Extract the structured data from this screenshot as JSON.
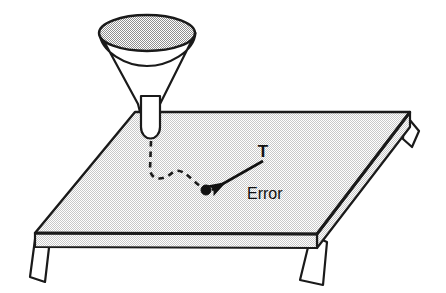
{
  "figure": {
    "background_color": "#ffffff",
    "ink_color": "#1a1a1a",
    "width": 446,
    "height": 293
  },
  "labels": {
    "target": "T",
    "error": "Error"
  },
  "colors": {
    "outline": "#1a1a1a",
    "table_top_fill": "#e8e8e8",
    "table_front_fill": "#e4e4e4",
    "table_right_fill": "#e0e0e0",
    "funnel_bowl_fill": "#d9d9d9",
    "funnel_cone_fill": "#ffffff",
    "funnel_stem_fill": "#ffffff",
    "leg_fill": "#ffffff",
    "dot_fill": "#111111",
    "text_color": "#111111"
  },
  "geometry": {
    "table_top": "135,112 410,112 317,234 35,233",
    "table_front": "35,233 317,234 317,247 35,246",
    "table_right": "317,234 410,112 410,126 317,247",
    "table_top_back_edge": "135,112 410,112",
    "legs": [
      {
        "name": "front-left-leg",
        "points": "35,233 49,238 44,281 31,277"
      },
      {
        "name": "front-right-leg",
        "points": "312,236 326,241 322,284 300,279"
      },
      {
        "name": "back-right-leg",
        "points": "404,114 418,130 412,146 402,141"
      }
    ],
    "funnel": {
      "bowl_ellipse": {
        "cx": 147,
        "cy": 33,
        "rx": 48,
        "ry": 18
      },
      "cone": "99,33 195,33 158,112 139,112",
      "stem": {
        "x": 141,
        "y": 96,
        "w": 19,
        "h": 40,
        "radius_bottom": 9
      }
    },
    "dashed_path": "M151,140 L150,168 C152,178 162,180 172,172 C182,164 190,178 203,188",
    "dot": {
      "cx": 206,
      "cy": 190,
      "r": 4.5
    },
    "arrow": {
      "from": "263,161",
      "to": "211,190"
    },
    "label_t_pos": {
      "x": 266,
      "y": 156
    },
    "label_error_pos": {
      "x": 248,
      "y": 198
    }
  }
}
